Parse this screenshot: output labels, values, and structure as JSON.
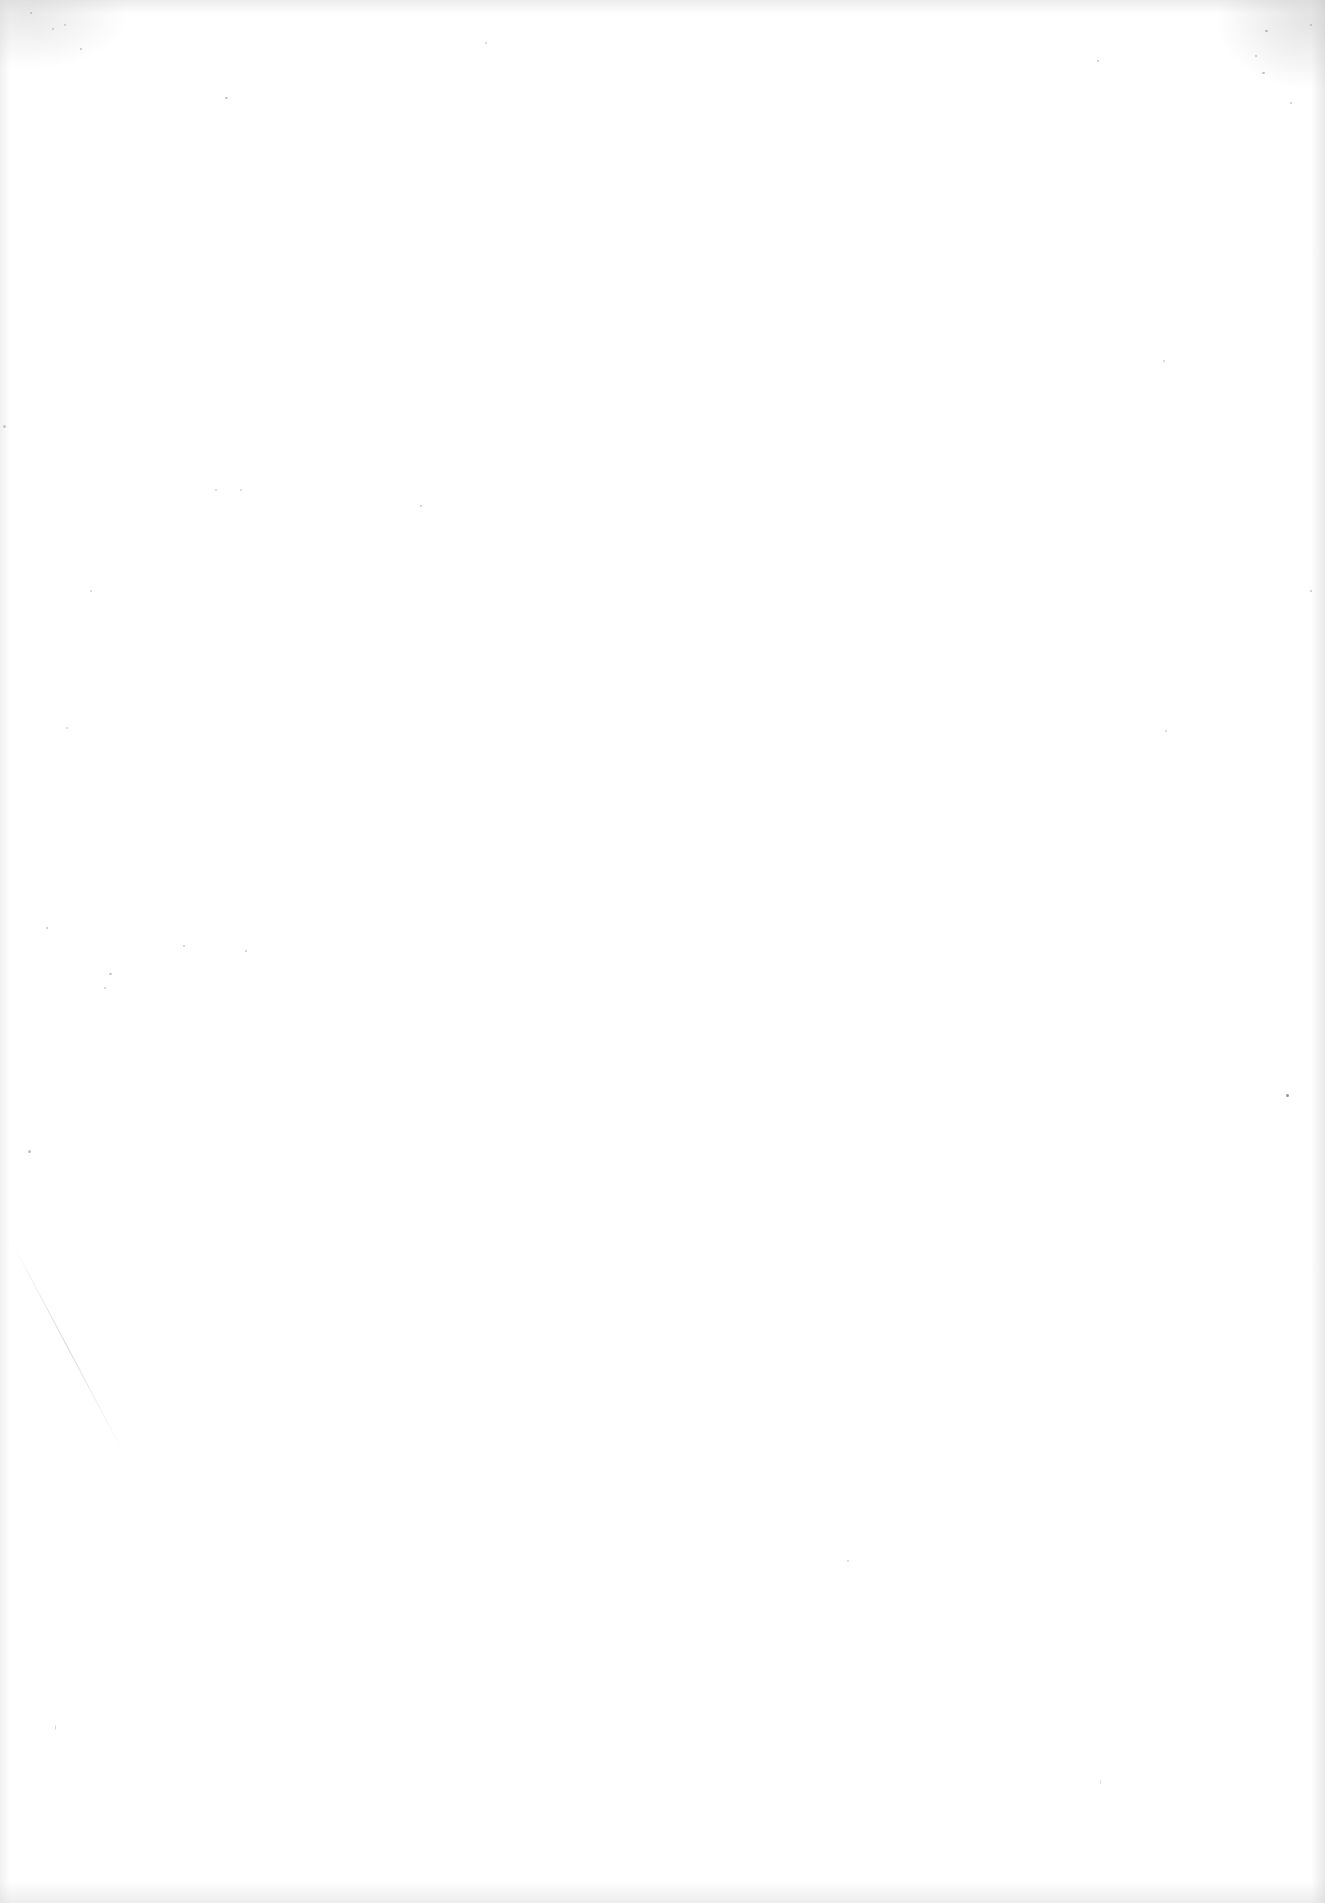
{
  "document": {
    "type": "scanned-page",
    "content": "",
    "background_color": "#ffffff"
  }
}
